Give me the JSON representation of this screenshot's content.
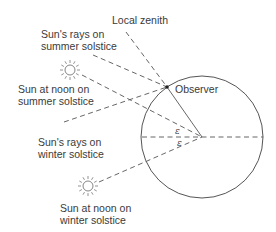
{
  "diagram": {
    "labels": {
      "local_zenith": "Local zenith",
      "summer_rays_line1": "Sun's rays on",
      "summer_rays_line2": "summer solstice",
      "summer_noon_line1": "Sun at noon on",
      "summer_noon_line2": "summer solstice",
      "observer": "Observer",
      "winter_rays_line1": "Sun's rays on",
      "winter_rays_line2": "winter solstice",
      "winter_noon_line1": "Sun at noon on",
      "winter_noon_line2": "winter solstice",
      "epsilon_upper": "ε",
      "epsilon_lower": "ε"
    },
    "icons": {
      "summer_sun": "sun-icon",
      "winter_sun": "sun-icon"
    },
    "colors": {
      "line": "#555555",
      "text": "#3a3a3a",
      "background": "#ffffff"
    }
  }
}
